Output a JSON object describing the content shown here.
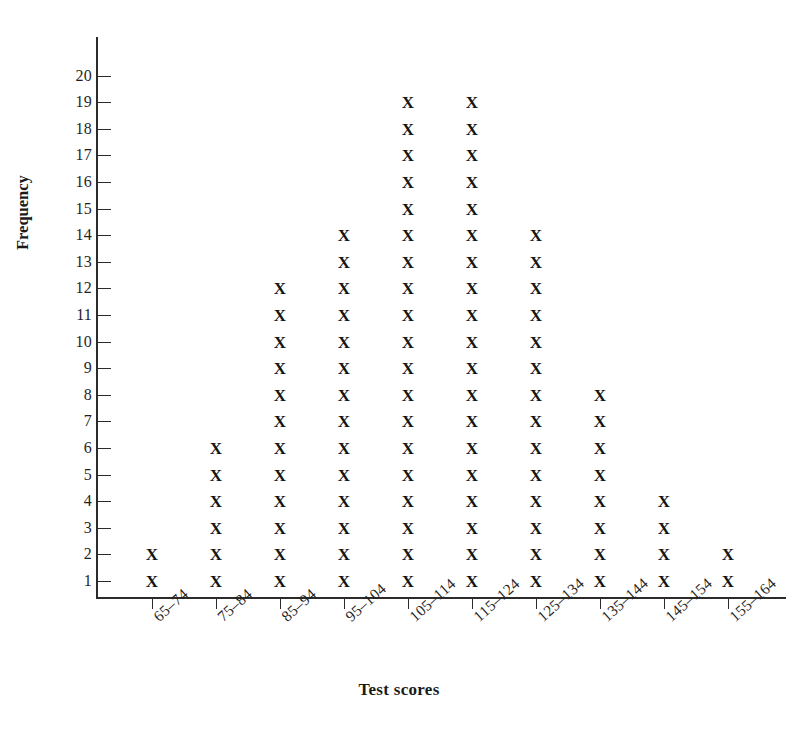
{
  "chart_data": {
    "type": "bar",
    "render_style": "dot-plot",
    "title": "",
    "xlabel": "Test scores",
    "ylabel": "Frequency",
    "categories": [
      "65–74",
      "75–84",
      "85–94",
      "95–104",
      "105–114",
      "115–124",
      "125–134",
      "135–144",
      "145–154",
      "155–164"
    ],
    "values": [
      2,
      6,
      12,
      14,
      19,
      19,
      14,
      8,
      4,
      2
    ],
    "marker": "X",
    "ylim": [
      0,
      20
    ],
    "ytick_labels": [
      "1",
      "2",
      "3",
      "4",
      "5",
      "6",
      "7",
      "8",
      "9",
      "10",
      "11",
      "12",
      "13",
      "14",
      "15",
      "16",
      "17",
      "18",
      "19",
      "20"
    ],
    "ytick_values": [
      1,
      2,
      3,
      4,
      5,
      6,
      7,
      8,
      9,
      10,
      11,
      12,
      13,
      14,
      15,
      16,
      17,
      18,
      19,
      20
    ],
    "grid": false,
    "legend": false,
    "legend_position": "none",
    "xtick_label_rotation": -42,
    "colors": {
      "marker": "#141414",
      "axis": "#2b2b2b",
      "text": "#1a1a1a",
      "background": "#ffffff"
    }
  }
}
